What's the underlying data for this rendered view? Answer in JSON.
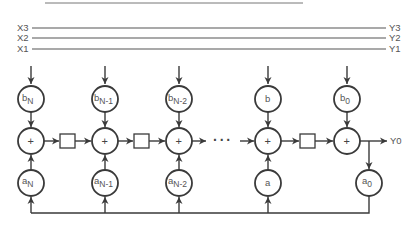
{
  "bus_lines": [
    {
      "in_label": "X3",
      "out_label": "Y3"
    },
    {
      "in_label": "X2",
      "out_label": "Y2"
    },
    {
      "in_label": "X1",
      "out_label": "Y1"
    }
  ],
  "filter": {
    "columns": [
      {
        "b_coeff": {
          "base": "b",
          "sub": "N"
        },
        "a_coeff": {
          "base": "a",
          "sub": "N"
        },
        "adder": "+"
      },
      {
        "b_coeff": {
          "base": "b",
          "sub": "N-1"
        },
        "a_coeff": {
          "base": "a",
          "sub": "N-1"
        },
        "adder": "+"
      },
      {
        "b_coeff": {
          "base": "b",
          "sub": "N-2"
        },
        "a_coeff": {
          "base": "a",
          "sub": "N-2"
        },
        "adder": "+"
      },
      {
        "b_coeff": {
          "base": "b",
          "sub": ""
        },
        "a_coeff": {
          "base": "a",
          "sub": ""
        },
        "adder": "+"
      },
      {
        "b_coeff": {
          "base": "b",
          "sub": "0"
        },
        "a_coeff": null,
        "adder": "+"
      }
    ],
    "feedback_coeff": {
      "base": "a",
      "sub": "0"
    },
    "ellipsis": "···",
    "output_label": "Y0"
  },
  "colors": {
    "stroke": "#3a3a3a",
    "text": "#555555",
    "background": "#ffffff"
  }
}
